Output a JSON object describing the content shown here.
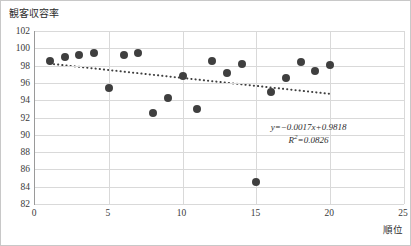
{
  "chart_data": {
    "type": "scatter",
    "title": "観客収容率",
    "xlabel": "順位",
    "ylabel": "",
    "xlim": [
      0,
      25
    ],
    "ylim": [
      82,
      102
    ],
    "xticks": [
      0,
      5,
      10,
      15,
      20,
      25
    ],
    "yticks": [
      82,
      84,
      86,
      88,
      90,
      92,
      94,
      96,
      98,
      100,
      102
    ],
    "grid": true,
    "legend": "none",
    "marker_color": "#3f3f3f",
    "trendline_color": "#3f3f3f",
    "gridline_color": "#d9d9d9",
    "axis_color": "#9a9a9a",
    "x": [
      1,
      2,
      3,
      4,
      5,
      6,
      7,
      8,
      9,
      10,
      11,
      12,
      13,
      14,
      15,
      16,
      17,
      18,
      19,
      20
    ],
    "y": [
      98.5,
      99.0,
      99.2,
      99.5,
      95.4,
      99.2,
      99.4,
      92.5,
      94.2,
      96.8,
      93.0,
      98.5,
      97.2,
      98.2,
      84.5,
      95.0,
      96.6,
      98.4,
      97.4,
      98.1
    ],
    "points": [
      {
        "x": 1,
        "y": 98.5
      },
      {
        "x": 2,
        "y": 99.0
      },
      {
        "x": 3,
        "y": 99.2
      },
      {
        "x": 4,
        "y": 99.5
      },
      {
        "x": 5,
        "y": 95.4
      },
      {
        "x": 6,
        "y": 99.2
      },
      {
        "x": 7,
        "y": 99.4
      },
      {
        "x": 8,
        "y": 92.5
      },
      {
        "x": 9,
        "y": 94.2
      },
      {
        "x": 10,
        "y": 96.8
      },
      {
        "x": 11,
        "y": 93.0
      },
      {
        "x": 12,
        "y": 98.5
      },
      {
        "x": 13,
        "y": 97.2
      },
      {
        "x": 14,
        "y": 98.2
      },
      {
        "x": 15,
        "y": 84.5
      },
      {
        "x": 16,
        "y": 95.0
      },
      {
        "x": 17,
        "y": 96.6
      },
      {
        "x": 18,
        "y": 98.4
      },
      {
        "x": 19,
        "y": 97.4
      },
      {
        "x": 20,
        "y": 98.1
      }
    ],
    "trendline": {
      "x_start": 1,
      "y_start": 98.2,
      "x_end": 20,
      "y_end": 94.7,
      "style": "dotted"
    },
    "annotations": {
      "equation": "y=−0.0017x+0.9818",
      "r_squared_label": "R",
      "r_squared_exponent": "2",
      "r_squared_value": "=0.0826"
    }
  }
}
